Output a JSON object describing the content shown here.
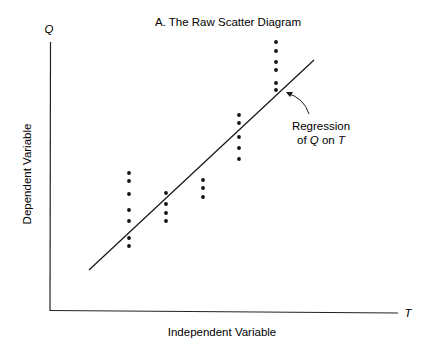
{
  "chart_data": {
    "type": "scatter",
    "title": "A. The Raw Scatter Diagram",
    "xlabel": "Independent Variable",
    "ylabel": "Dependent Variable",
    "x_axis_symbol": "T",
    "y_axis_symbol": "Q",
    "grid": false,
    "legend": null,
    "annotation": {
      "line1": "Regression",
      "line2_prefix": "of ",
      "line2_q": "Q",
      "line2_mid": " on ",
      "line2_t": "T"
    },
    "regression_line": {
      "x1": 89,
      "y1": 270,
      "x2": 314,
      "y2": 60
    },
    "columns": [
      {
        "x": 129,
        "y": [
          173,
          181,
          194,
          210,
          221,
          238,
          246
        ]
      },
      {
        "x": 166,
        "y": [
          193,
          204,
          213,
          221
        ]
      },
      {
        "x": 203,
        "y": [
          180,
          188,
          197
        ]
      },
      {
        "x": 239,
        "y": [
          115,
          123,
          137,
          148,
          159
        ]
      },
      {
        "x": 276,
        "y": [
          42,
          51,
          62,
          70,
          83,
          90
        ]
      }
    ],
    "note": "Values are in pixel coordinates; axes have no numeric ticks."
  }
}
